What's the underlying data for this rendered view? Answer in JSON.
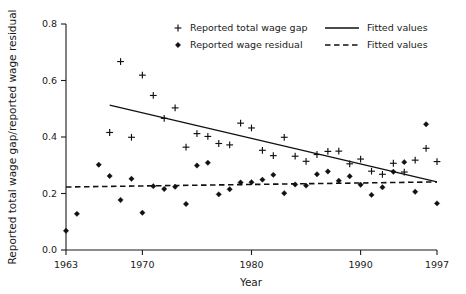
{
  "chart_data": {
    "type": "scatter",
    "title": "",
    "xlabel": "Year",
    "ylabel": "Reported total wage gap/reported wage residual",
    "xlim": [
      1963,
      1997
    ],
    "ylim": [
      0.0,
      0.8
    ],
    "grid": false,
    "legend_position": "top-center",
    "xticks": [
      "1963",
      "1970",
      "1980",
      "1990",
      "1997"
    ],
    "xtick_values": [
      1963,
      1970,
      1980,
      1990,
      1997
    ],
    "yticks": [
      "0.0",
      "0.2",
      "0.4",
      "0.6",
      "0.8"
    ],
    "ytick_values": [
      0.0,
      0.2,
      0.4,
      0.6,
      0.8
    ],
    "series": [
      {
        "name": "Reported total wage gap",
        "marker": "plus",
        "x": [
          1967,
          1968,
          1969,
          1970,
          1971,
          1972,
          1973,
          1974,
          1975,
          1976,
          1977,
          1978,
          1979,
          1980,
          1981,
          1982,
          1983,
          1984,
          1985,
          1986,
          1987,
          1988,
          1989,
          1990,
          1991,
          1992,
          1993,
          1994,
          1995,
          1996,
          1997
        ],
        "values": [
          0.416,
          0.667,
          0.399,
          0.619,
          0.547,
          0.466,
          0.503,
          0.364,
          0.412,
          0.402,
          0.377,
          0.372,
          0.449,
          0.432,
          0.353,
          0.334,
          0.399,
          0.332,
          0.314,
          0.338,
          0.349,
          0.35,
          0.305,
          0.322,
          0.279,
          0.268,
          0.307,
          0.276,
          0.318,
          0.36,
          0.313
        ]
      },
      {
        "name": "Reported wage residual",
        "marker": "diamond",
        "x": [
          1963,
          1964,
          1966,
          1967,
          1968,
          1969,
          1970,
          1971,
          1972,
          1973,
          1974,
          1975,
          1976,
          1977,
          1978,
          1979,
          1980,
          1981,
          1982,
          1983,
          1984,
          1985,
          1986,
          1987,
          1988,
          1989,
          1990,
          1991,
          1992,
          1993,
          1994,
          1995,
          1996,
          1997
        ],
        "values": [
          0.068,
          0.128,
          0.302,
          0.262,
          0.177,
          0.252,
          0.132,
          0.226,
          0.216,
          0.224,
          0.163,
          0.299,
          0.309,
          0.197,
          0.215,
          0.239,
          0.24,
          0.249,
          0.266,
          0.201,
          0.232,
          0.228,
          0.268,
          0.278,
          0.245,
          0.261,
          0.231,
          0.195,
          0.222,
          0.277,
          0.311,
          0.206,
          0.445,
          0.165
        ]
      }
    ],
    "fits": [
      {
        "name": "Fitted values",
        "style": "solid",
        "for_series": "Reported total wage gap",
        "x_start": 1967,
        "x_end": 1997,
        "y_start": 0.513,
        "y_end": 0.241
      },
      {
        "name": "Fitted values",
        "style": "dashed",
        "for_series": "Reported wage residual",
        "x_start": 1963,
        "x_end": 1997,
        "y_start": 0.223,
        "y_end": 0.241
      }
    ]
  },
  "legend": {
    "entries": [
      {
        "label": "Reported total wage gap",
        "marker": "plus"
      },
      {
        "label": "Reported wage residual",
        "marker": "diamond"
      },
      {
        "label": "Fitted values",
        "marker": "solid-line"
      },
      {
        "label": "Fitted values",
        "marker": "dashed-line"
      }
    ]
  },
  "colors": {
    "foreground": "#111111",
    "background": "#ffffff"
  }
}
